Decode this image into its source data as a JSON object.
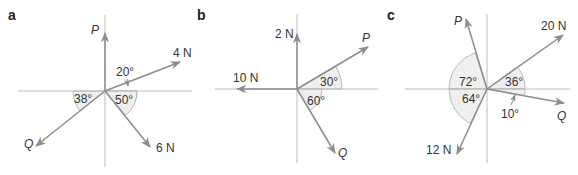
{
  "panels": [
    {
      "id": "a",
      "label": "a",
      "forces": [
        {
          "name": "P",
          "direction_deg": 90
        },
        {
          "name": "4 N",
          "direction_deg": 20
        },
        {
          "name": "6 N",
          "direction_deg": -50
        },
        {
          "name": "Q",
          "direction_deg": 218
        }
      ],
      "angles": [
        "20°",
        "50°",
        "38°"
      ]
    },
    {
      "id": "b",
      "label": "b",
      "forces": [
        {
          "name": "2 N",
          "direction_deg": 90
        },
        {
          "name": "P",
          "direction_deg": 30
        },
        {
          "name": "10 N",
          "direction_deg": 180
        },
        {
          "name": "Q",
          "direction_deg": -60
        }
      ],
      "angles": [
        "30°",
        "60°"
      ]
    },
    {
      "id": "c",
      "label": "c",
      "forces": [
        {
          "name": "P",
          "direction_deg": 108
        },
        {
          "name": "20 N",
          "direction_deg": 36
        },
        {
          "name": "Q",
          "direction_deg": -10
        },
        {
          "name": "12 N",
          "direction_deg": 244
        }
      ],
      "angles": [
        "72°",
        "36°",
        "64°",
        "10°"
      ]
    }
  ],
  "colors": {
    "axis": "#bdbdbd",
    "vector": "#8c8c8c",
    "arc_fill": "#efefef",
    "text": "#333333"
  }
}
